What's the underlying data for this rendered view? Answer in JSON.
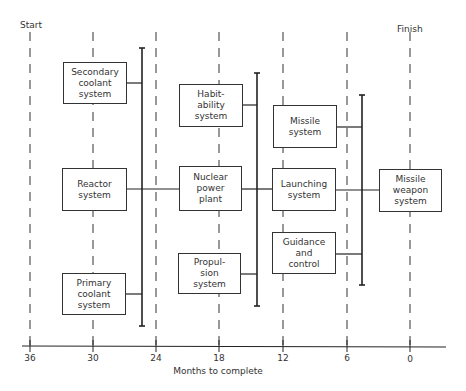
{
  "diagram": {
    "start_label": "Start",
    "finish_label": "Finish",
    "axis": {
      "title": "Months to complete",
      "ticks": [
        {
          "label": "36",
          "x": 30
        },
        {
          "label": "30",
          "x": 93
        },
        {
          "label": "24",
          "x": 156
        },
        {
          "label": "18",
          "x": 219
        },
        {
          "label": "12",
          "x": 283
        },
        {
          "label": "6",
          "x": 347
        },
        {
          "label": "0",
          "x": 410
        }
      ]
    },
    "boxes": [
      {
        "id": "secondary-coolant-system",
        "label": "Secondary\ncoolant\nsystem",
        "x": 63,
        "y": 62,
        "w": 64,
        "h": 42
      },
      {
        "id": "reactor-system",
        "label": "Reactor\nsystem",
        "x": 62,
        "y": 168,
        "w": 65,
        "h": 43
      },
      {
        "id": "primary-coolant-system",
        "label": "Primary\ncoolant\nsystem",
        "x": 62,
        "y": 273,
        "w": 64,
        "h": 42
      },
      {
        "id": "habitability-system",
        "label": "Habit-\nability\nsystem",
        "x": 179,
        "y": 84,
        "w": 64,
        "h": 43
      },
      {
        "id": "nuclear-power-plant",
        "label": "Nuclear\npower\nplant",
        "x": 179,
        "y": 166,
        "w": 63,
        "h": 45
      },
      {
        "id": "propulsion-system",
        "label": "Propul-\nsion\nsystem",
        "x": 178,
        "y": 253,
        "w": 63,
        "h": 41
      },
      {
        "id": "missile-system",
        "label": "Missile\nsystem",
        "x": 273,
        "y": 105,
        "w": 64,
        "h": 43
      },
      {
        "id": "launching-system",
        "label": "Launching\nsystem",
        "x": 272,
        "y": 168,
        "w": 64,
        "h": 43
      },
      {
        "id": "guidance-and-control",
        "label": "Guidance\nand\ncontrol",
        "x": 272,
        "y": 232,
        "w": 64,
        "h": 42
      },
      {
        "id": "missile-weapon-system",
        "label": "Missile\nweapon\nsystem",
        "x": 379,
        "y": 169,
        "w": 63,
        "h": 43
      }
    ]
  }
}
